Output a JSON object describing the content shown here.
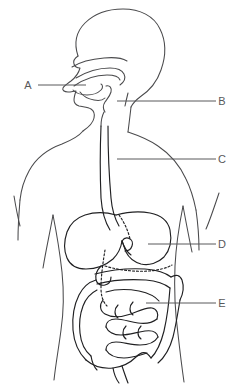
{
  "diagram": {
    "background_color": "#ffffff",
    "line_color": "#4a4a4c",
    "label_color": "#58585a",
    "labels": [
      {
        "id": "A",
        "letter": "A",
        "side": "left",
        "text_x": 28,
        "text_y": 89,
        "leader_x1": 38,
        "leader_y1": 85,
        "leader_x2": 86,
        "leader_y2": 85,
        "organ": "oral-cavity-mouth-tongue"
      },
      {
        "id": "B",
        "letter": "B",
        "side": "right",
        "text_x": 220,
        "text_y": 105,
        "leader_x1": 117,
        "leader_y1": 101,
        "leader_x2": 216,
        "leader_y2": 101,
        "organ": "pharynx-epiglottis"
      },
      {
        "id": "C",
        "letter": "C",
        "side": "right",
        "text_x": 220,
        "text_y": 163,
        "leader_x1": 117,
        "leader_y1": 159,
        "leader_x2": 216,
        "leader_y2": 159,
        "organ": "esophagus"
      },
      {
        "id": "D",
        "letter": "D",
        "side": "right",
        "text_x": 220,
        "text_y": 248,
        "leader_x1": 148,
        "leader_y1": 244,
        "leader_x2": 216,
        "leader_y2": 244,
        "organ": "stomach"
      },
      {
        "id": "E",
        "letter": "E",
        "side": "right",
        "text_x": 220,
        "text_y": 307,
        "leader_x1": 146,
        "leader_y1": 303,
        "leader_x2": 216,
        "leader_y2": 303,
        "organ": "small-intestine"
      }
    ]
  }
}
